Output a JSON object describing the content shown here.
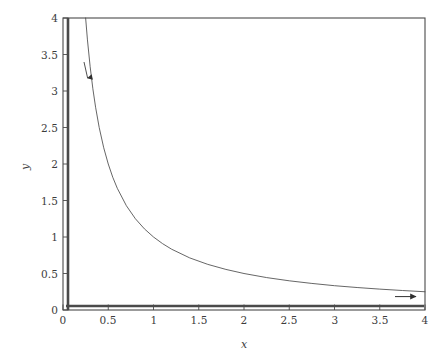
{
  "chart_data": {
    "type": "line",
    "title": "",
    "subtitle": "",
    "xlabel": "x",
    "ylabel": "y",
    "xlim": [
      0,
      4
    ],
    "ylim": [
      0,
      4
    ],
    "xticks": [
      "0",
      "0.5",
      "1",
      "1.5",
      "2",
      "2.5",
      "3",
      "3.5",
      "4"
    ],
    "xtick_values": [
      0,
      0.5,
      1,
      1.5,
      2,
      2.5,
      3,
      3.5,
      4
    ],
    "yticks": [
      "0",
      "0.5",
      "1",
      "1.5",
      "2",
      "2.5",
      "3",
      "3.5",
      "4"
    ],
    "ytick_values": [
      0,
      0.5,
      1,
      1.5,
      2,
      2.5,
      3,
      3.5,
      4
    ],
    "grid": false,
    "legend": null,
    "legend_position": "none",
    "series": [
      {
        "name": "hyperbola-trajectory",
        "equation": "y = 1/x",
        "color": "#4a4a4a",
        "linewidth": 0.8,
        "arrow": {
          "direction": "down-right",
          "at_x": 0.32,
          "at_y": 3.2
        },
        "x": [
          0.25,
          0.27,
          0.3,
          0.33,
          0.36,
          0.4,
          0.45,
          0.5,
          0.55,
          0.6,
          0.7,
          0.8,
          0.9,
          1.0,
          1.1,
          1.2,
          1.4,
          1.6,
          1.8,
          2.0,
          2.25,
          2.5,
          2.75,
          3.0,
          3.25,
          3.5,
          3.75,
          4.0
        ],
        "y": [
          4.0,
          3.7,
          3.333,
          3.03,
          2.778,
          2.5,
          2.222,
          2.0,
          1.818,
          1.667,
          1.429,
          1.25,
          1.111,
          1.0,
          0.909,
          0.833,
          0.714,
          0.625,
          0.556,
          0.5,
          0.444,
          0.4,
          0.364,
          0.333,
          0.308,
          0.286,
          0.267,
          0.25
        ]
      },
      {
        "name": "x-axis-invariant-line",
        "equation": "y = 0",
        "color": "#4a4a4a",
        "linewidth": 2.4,
        "arrow": {
          "direction": "right",
          "at_x": 4.0,
          "at_y": 0.0
        },
        "x": [
          0,
          4
        ],
        "y": [
          0,
          0
        ]
      },
      {
        "name": "y-axis-invariant-line",
        "equation": "x = 0",
        "color": "#4a4a4a",
        "linewidth": 2.4,
        "arrow": {
          "direction": "none",
          "at_x": 0.0,
          "at_y": 4.0
        },
        "x": [
          0,
          0
        ],
        "y": [
          0,
          4
        ]
      }
    ],
    "annotations": [
      {
        "name": "flow-arrow-upper",
        "text": "",
        "x": 0.32,
        "y": 3.2
      },
      {
        "name": "flow-arrow-right",
        "text": "",
        "x": 3.9,
        "y": 0.25
      }
    ]
  },
  "axes": {
    "x_title": "x",
    "y_title": "y",
    "frame_color": "#4a4a4a"
  }
}
